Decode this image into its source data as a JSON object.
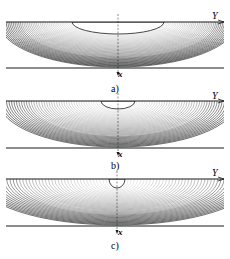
{
  "figure": {
    "panels": [
      {
        "id": "a",
        "caption": "a)",
        "axis_y_label": "Y",
        "axis_x_label": "x",
        "top_line_y": 22,
        "bottom_line_y": 68,
        "opening": {
          "cx": 118,
          "half_width": 46,
          "depth": 12
        },
        "bowl_depth": 66,
        "caption_y": 92
      },
      {
        "id": "b",
        "caption": "b)",
        "axis_y_label": "Y",
        "axis_x_label": "x",
        "top_line_y": 101,
        "bottom_line_y": 148,
        "opening": {
          "cx": 118,
          "half_width": 17,
          "depth": 8
        },
        "bowl_depth": 144,
        "caption_y": 169
      },
      {
        "id": "c",
        "caption": "c)",
        "axis_y_label": "Y",
        "axis_x_label": "x",
        "top_line_y": 179,
        "bottom_line_y": 226,
        "opening": {
          "cx": 117,
          "half_width": 8,
          "depth": 9
        },
        "bowl_depth": 222,
        "caption_y": 248
      }
    ],
    "colors": {
      "line": "#1a1a1a",
      "contour": "#3a3a3a",
      "dense": "#0d0d0d"
    }
  }
}
